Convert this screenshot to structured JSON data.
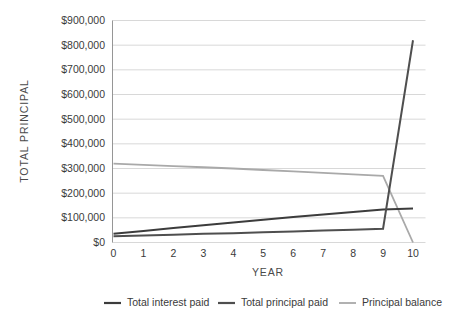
{
  "chart_data": {
    "type": "line",
    "title": "",
    "xlabel": "YEAR",
    "ylabel": "TOTAL PRINCIPAL",
    "x": [
      0,
      1,
      2,
      3,
      4,
      5,
      6,
      7,
      8,
      9,
      10
    ],
    "xtick_labels": [
      "0",
      "1",
      "2",
      "3",
      "4",
      "5",
      "6",
      "7",
      "8",
      "9",
      "10"
    ],
    "ytick_labels": [
      "$0",
      "$100,000",
      "$200,000",
      "$300,000",
      "$400,000",
      "$500,000",
      "$600,000",
      "$700,000",
      "$800,000",
      "$900,000"
    ],
    "ytick_values": [
      0,
      100000,
      200000,
      300000,
      400000,
      500000,
      600000,
      700000,
      800000,
      900000
    ],
    "ylim": [
      0,
      900000
    ],
    "xlim": [
      0,
      10
    ],
    "grid": "horizontal",
    "legend_position": "bottom",
    "series": [
      {
        "name": "Total interest paid",
        "color": "#3c3c3c",
        "width": 2.0,
        "values": [
          35000,
          47000,
          59000,
          70000,
          81000,
          92000,
          103000,
          114000,
          124000,
          134000,
          138000
        ]
      },
      {
        "name": "Total principal paid",
        "color": "#4f4f4f",
        "width": 2.0,
        "values": [
          25000,
          28000,
          31000,
          35000,
          38000,
          42000,
          45000,
          49000,
          52000,
          56000,
          820000
        ]
      },
      {
        "name": "Principal balance",
        "color": "#a9a9a9",
        "width": 1.8,
        "values": [
          320000,
          315000,
          310000,
          305000,
          300000,
          294000,
          288000,
          282000,
          276000,
          270000,
          0
        ]
      }
    ]
  },
  "legend": {
    "items": [
      {
        "label": "Total interest paid",
        "color": "#3c3c3c"
      },
      {
        "label": "Total principal paid",
        "color": "#4f4f4f"
      },
      {
        "label": "Principal balance",
        "color": "#a9a9a9"
      }
    ]
  }
}
